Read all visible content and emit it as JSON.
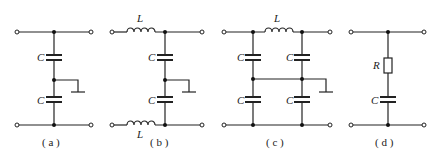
{
  "figure": {
    "circuits": [
      {
        "id": "a",
        "caption": "( a )",
        "components": [
          "C",
          "C"
        ],
        "cap_labels": [
          "C",
          "C"
        ]
      },
      {
        "id": "b",
        "caption": "( b )",
        "components": [
          "L",
          "C",
          "C",
          "L"
        ],
        "ind_labels": [
          "L",
          "L"
        ],
        "cap_labels": [
          "C",
          "C"
        ]
      },
      {
        "id": "c",
        "caption": "( c )",
        "components": [
          "L",
          "C",
          "C",
          "C",
          "C"
        ],
        "ind_labels": [
          "L"
        ],
        "cap_labels": [
          "C",
          "C",
          "C",
          "C"
        ]
      },
      {
        "id": "d",
        "caption": "( d )",
        "components": [
          "R",
          "C"
        ],
        "res_labels": [
          "R"
        ],
        "cap_labels": [
          "C"
        ]
      }
    ]
  },
  "colors": {
    "line": "#222222",
    "background": "#ffffff"
  }
}
